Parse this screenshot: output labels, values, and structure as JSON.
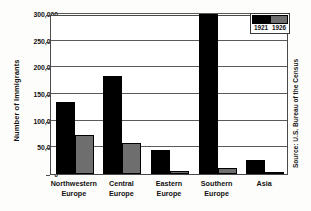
{
  "chart_data": {
    "type": "bar",
    "title": "",
    "xlabel": "",
    "ylabel": "Number of Immigrants",
    "ylim": [
      0,
      300000
    ],
    "yticks": [
      0,
      50000,
      100000,
      150000,
      200000,
      250000,
      300000
    ],
    "ytick_labels": [
      "0",
      "50,000",
      "100,000",
      "150,000",
      "200,000",
      "250,000",
      "300,000"
    ],
    "grid": true,
    "legend_position": "top-right",
    "categories": [
      "Northwestern Europe",
      "Central Europe",
      "Eastern Europe",
      "Southern Europe",
      "Asia"
    ],
    "category_lines": [
      [
        "Northwestern",
        "Europe"
      ],
      [
        "Central",
        "Europe"
      ],
      [
        "Eastern",
        "Europe"
      ],
      [
        "Southern",
        "Europe"
      ],
      [
        "Asia",
        ""
      ]
    ],
    "series": [
      {
        "name": "1921",
        "color": "#000000",
        "values": [
          135000,
          183000,
          45000,
          300000,
          26000
        ]
      },
      {
        "name": "1926",
        "color": "#6e6e6e",
        "values": [
          73000,
          58000,
          5000,
          12000,
          3000
        ]
      }
    ],
    "annotations": {
      "source": "Source: U.S. Bureau of the Census"
    }
  }
}
